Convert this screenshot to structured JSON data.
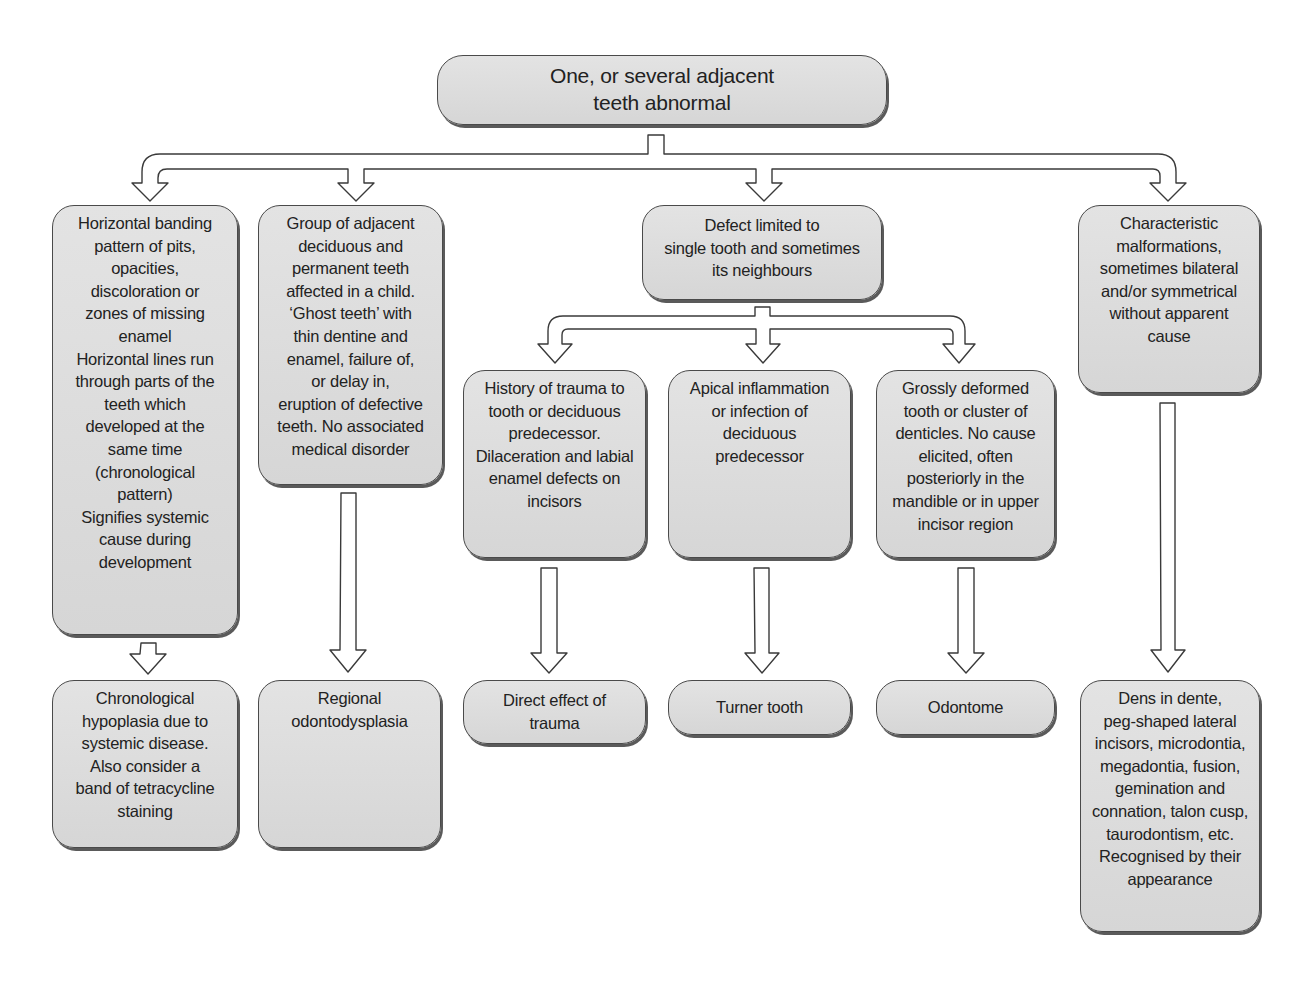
{
  "diagram": {
    "type": "flowchart",
    "root": {
      "id": "root",
      "text": "One, or several adjacent\nteeth abnormal"
    },
    "branches": [
      {
        "id": "banding",
        "text": "Horizontal banding\npattern of pits,\nopacities,\ndiscoloration or\nzones of missing\nenamel\nHorizontal lines run\nthrough parts of the\nteeth which\ndeveloped at the\nsame time\n(chronological\npattern)\nSignifies systemic\ncause during\ndevelopment",
        "outcome": {
          "id": "chronological-hypoplasia",
          "text": "Chronological\nhypoplasia due to\nsystemic disease.\nAlso consider a\nband of tetracycline\nstaining"
        }
      },
      {
        "id": "ghost-teeth",
        "text": "Group of adjacent\ndeciduous and\npermanent teeth\naffected in a child.\n‘Ghost teeth’ with\nthin dentine and\nenamel, failure of,\nor delay in,\neruption of defective\nteeth. No associated\nmedical disorder",
        "outcome": {
          "id": "regional-odontodysplasia",
          "text": "Regional\nodontodysplasia"
        }
      },
      {
        "id": "single-tooth",
        "text": "Defect limited to\nsingle tooth and sometimes\nits neighbours",
        "children": [
          {
            "id": "trauma",
            "text": "History of trauma to\ntooth or deciduous\npredecessor.\nDilaceration and labial\nenamel defects on\nincisors",
            "outcome": {
              "id": "direct-effect-trauma",
              "text": "Direct effect of\ntrauma"
            }
          },
          {
            "id": "apical-inflammation",
            "text": "Apical inflammation\nor infection of\ndeciduous\npredecessor",
            "outcome": {
              "id": "turner-tooth",
              "text": "Turner tooth"
            }
          },
          {
            "id": "grossly-deformed",
            "text": "Grossly deformed\ntooth or cluster of\ndenticles. No cause\nelicited, often\nposteriorly in the\nmandible or in upper\nincisor region",
            "outcome": {
              "id": "odontome",
              "text": "Odontome"
            }
          }
        ]
      },
      {
        "id": "characteristic-malformations",
        "text": "Characteristic\nmalformations,\nsometimes bilateral\nand/or symmetrical\nwithout apparent\ncause",
        "outcome": {
          "id": "dens-in-dente",
          "text": "Dens in dente,\npeg-shaped lateral\nincisors, microdontia,\nmegadontia, fusion,\ngemination and\nconnation, talon cusp,\ntaurodontism, etc.\nRecognised by their\nappearance"
        }
      }
    ]
  },
  "colors": {
    "node_fill": "#dcdcdc",
    "node_border": "#4a4a4a",
    "node_shadow": "#5a5a5a",
    "arrow_fill": "#ffffff",
    "arrow_stroke": "#3a3a3a",
    "text": "#222222",
    "background": "#ffffff"
  }
}
